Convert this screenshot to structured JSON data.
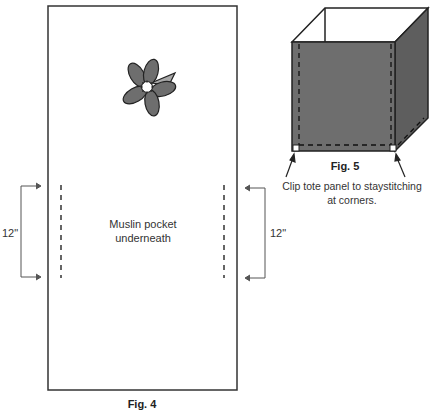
{
  "fig4": {
    "caption": "Fig. 4",
    "pocket_label_line1": "Muslin pocket",
    "pocket_label_line2": "underneath",
    "left_dimension": "12\"",
    "right_dimension": "12\"",
    "flower_icon": "flower-appliqué"
  },
  "fig5": {
    "caption": "Fig. 5",
    "instruction_line1": "Clip tote panel to staystitching",
    "instruction_line2": "at corners.",
    "panel_color": "#6b6b6b",
    "side_color": "#5a5a5a"
  }
}
